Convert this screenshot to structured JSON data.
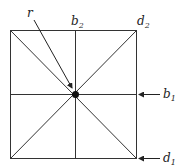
{
  "diagram": {
    "labels": {
      "r": "r",
      "b2_base": "b",
      "b2_sub": "2",
      "d2_base": "d",
      "d2_sub": "2",
      "b1_base": "b",
      "b1_sub": "1",
      "d1_base": "d",
      "d1_sub": "1"
    },
    "colors": {
      "line": "#333333",
      "center_point": "#111111"
    }
  }
}
